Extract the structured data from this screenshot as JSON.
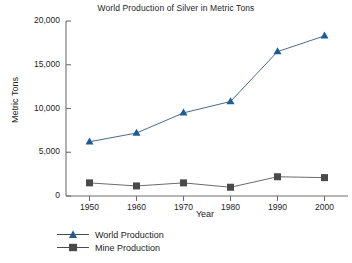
{
  "chart_data": {
    "type": "line",
    "title": "World Production of Silver in Metric Tons",
    "xlabel": "Year",
    "ylabel": "Metric Tons",
    "x": [
      1950,
      1960,
      1970,
      1980,
      1990,
      2000
    ],
    "xtick_labels": [
      "1950",
      "1960",
      "1970",
      "1980",
      "1990",
      "2000"
    ],
    "ytick_labels": [
      "0",
      "5,000",
      "10,000",
      "15,000",
      "20,000"
    ],
    "yticks": [
      0,
      5000,
      10000,
      15000,
      20000
    ],
    "xlim": [
      1945,
      2005
    ],
    "ylim": [
      0,
      20000
    ],
    "grid": false,
    "legend_position": "bottom-left",
    "series": [
      {
        "name": "World Production",
        "marker": "triangle",
        "color": "#1f5c96",
        "values": [
          6200,
          7200,
          9500,
          10800,
          16500,
          18300
        ]
      },
      {
        "name": "Mine Production",
        "marker": "square",
        "color": "#4a4a4a",
        "values": [
          1500,
          1150,
          1500,
          1000,
          2200,
          2100
        ]
      }
    ]
  },
  "legend": {
    "items": [
      {
        "label": "World Production"
      },
      {
        "label": "Mine Production"
      }
    ]
  },
  "axis": {
    "spine_color": "#6e6e6e"
  }
}
